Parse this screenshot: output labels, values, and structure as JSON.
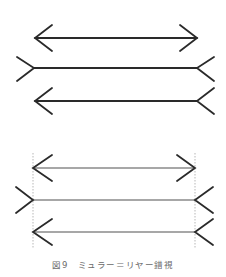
{
  "figure": {
    "caption": "図9　ミュラー＝リヤー錯視",
    "colors": {
      "stroke_dark": "#2a2a2a",
      "shaft_gray": "#8a8a8a",
      "guide_dashed": "#9a9a9a",
      "caption": "#6a6a6a",
      "background": "#ffffff"
    },
    "panels": [
      {
        "id": "top",
        "description": "Three horizontal lines of equal length with different arrowhead configurations",
        "lines": [
          {
            "y": 38,
            "x1": 35,
            "x2": 197,
            "left": "arrow-in",
            "right": "arrow-out"
          },
          {
            "y": 68,
            "x1": 34,
            "x2": 197,
            "left": "fin-out",
            "right": "fin-out"
          },
          {
            "y": 101,
            "x1": 35,
            "x2": 197,
            "left": "arrow-in",
            "right": "fin-out"
          }
        ]
      },
      {
        "id": "bottom",
        "description": "Same three lines with dashed vertical guides showing equal length",
        "guides_x": [
          33,
          195
        ],
        "lines": [
          {
            "y": 168,
            "x1": 33,
            "x2": 195,
            "left": "arrow-in",
            "right": "arrow-out"
          },
          {
            "y": 200,
            "x1": 33,
            "x2": 195,
            "left": "fin-out",
            "right": "fin-out"
          },
          {
            "y": 232,
            "x1": 33,
            "x2": 195,
            "left": "arrow-in",
            "right": "fin-out"
          }
        ]
      }
    ]
  }
}
